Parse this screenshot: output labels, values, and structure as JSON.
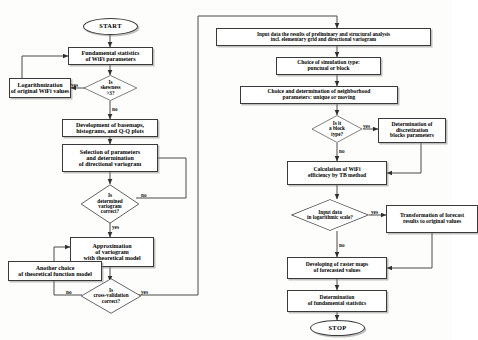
{
  "diagram": {
    "type": "flowchart",
    "line_color": "#3a3a3a",
    "background": "#fdfdfc"
  },
  "left_branch": {
    "start": "START",
    "n1": "Fundamental statistics\nof WiFi parameters",
    "n2_line1": "Is",
    "n2_line2": "skewness",
    "n2_line3": ">3?",
    "n3": "Logarithmization\nof original WiFi values",
    "n4": "Development of basemaps,\nhistograms, and Q-Q plots",
    "n5": "Selection of parameters\nand determination\nof directional variogram",
    "n6_line1": "Is",
    "n6_line2": "determined",
    "n6_line3": "variogram",
    "n6_line4": "correct?",
    "n7": "Approximation\nof variogram\nwith theoretical model",
    "n8": "Another choice\nof theoretical function model",
    "n9_line1": "Is",
    "n9_line2": "cross-validation",
    "n9_line3": "correct?"
  },
  "right_branch": {
    "r1": "Input data the results of preliminary and structural analysis\nincl. elementary grid and directional variogram",
    "r2": "Choice of simulation type:\npunctual or block",
    "r3": "Choice and determination of neighborhood\nparameters: unique or moving",
    "r4_line1": "Is it",
    "r4_line2": "a block",
    "r4_line3": "type?",
    "r5": "Determination of discretization\nblocks parameters",
    "r6": "Calculation of WiFi\nefficiency by TB method",
    "r7_line1": "Input data",
    "r7_line2": "in logarithmic scale?",
    "r8": "Transformation of forecast\nresults to original values",
    "r9": "Developing of raster maps\nof forecasted values",
    "r10": "Determination\nof fundamental statistics",
    "stop": "STOP"
  },
  "edge_labels": {
    "skew_yes": "yes",
    "skew_no": "no",
    "variogram_no": "no",
    "variogram_yes": "yes",
    "crossval_no": "no",
    "crossval_yes": "yes",
    "block_yes": "yes",
    "block_no": "no",
    "log_yes": "yes",
    "log_no": "no"
  }
}
